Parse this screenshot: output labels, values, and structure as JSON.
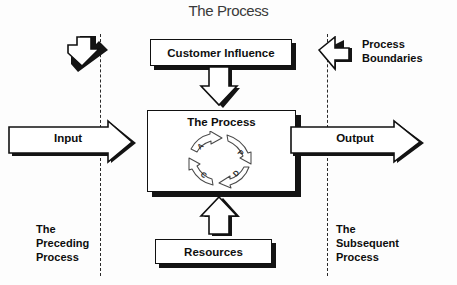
{
  "diagram": {
    "title": "The Process",
    "type": "process-boundary-diagram"
  },
  "boxes": {
    "customer_influence": "Customer Influence",
    "process": "The Process",
    "resources": "Resources"
  },
  "flows": {
    "input_label": "Input",
    "output_label": "Output",
    "customer_arrow_name": "down-arrow-icon",
    "resources_arrow_name": "up-arrow-icon"
  },
  "cycle": {
    "name": "pdca-cycle",
    "segments": [
      {
        "letter": "A",
        "position": "top-left"
      },
      {
        "letter": "P",
        "position": "top-right"
      },
      {
        "letter": "D",
        "position": "bottom-right"
      },
      {
        "letter": "C",
        "position": "bottom-left"
      }
    ]
  },
  "annotations": {
    "process_boundaries": "Process\nBoundaries",
    "preceding_process": "The\nPreceding\nProcess",
    "subsequent_process": "The\nSubsequent\nProcess"
  },
  "colors": {
    "line": "#111111",
    "shadow": "#141414",
    "background": "#fdfdfd",
    "text": "#0d0d0d",
    "title": "#3a3a3a"
  }
}
